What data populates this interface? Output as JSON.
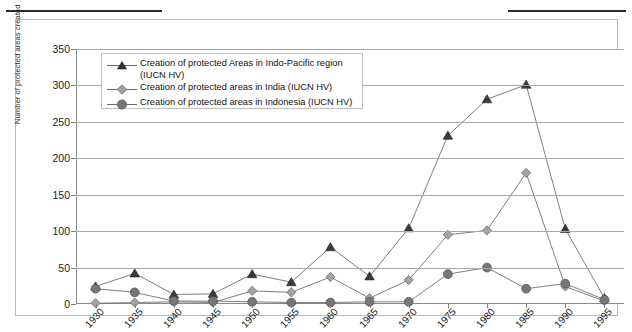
{
  "chart_data": {
    "type": "line",
    "title": "",
    "xlabel": "",
    "ylabel": "Number of protected areas created",
    "ylim": [
      0,
      350
    ],
    "ytick_labels": [
      "0",
      "50",
      "100",
      "150",
      "200",
      "250",
      "300",
      "350"
    ],
    "ytick_values": [
      0,
      50,
      100,
      150,
      200,
      250,
      300,
      350
    ],
    "grid": "horizontal",
    "legend_position": "top-left-inside",
    "categories": [
      "1930",
      "1935",
      "1940",
      "1945",
      "1950",
      "1955",
      "1960",
      "1965",
      "1970",
      "1975",
      "1980",
      "1985",
      "1990",
      "1995"
    ],
    "series": [
      {
        "name": "Creation of protected Areas in Indo-Pacific region (IUCN HV)",
        "marker": "triangle",
        "color": "#3a3a3a",
        "values": [
          24,
          42,
          13,
          14,
          41,
          30,
          78,
          38,
          104,
          231,
          281,
          301,
          103,
          8
        ]
      },
      {
        "name": "Creation of protected areas in India (IUCN HV)",
        "marker": "diamond",
        "color": "#8c8c8c",
        "values": [
          1,
          2,
          3,
          2,
          18,
          16,
          37,
          8,
          33,
          95,
          101,
          180,
          24,
          4
        ]
      },
      {
        "name": "Creation of protected areas in Indonesia (IUCN HV)",
        "marker": "circle",
        "color": "#6b6b6b",
        "values": [
          21,
          16,
          4,
          4,
          3,
          2,
          2,
          3,
          3,
          41,
          50,
          21,
          28,
          6
        ]
      }
    ]
  },
  "legend": {
    "items": [
      {
        "label_line1": "Creation of protected Areas in Indo-Pacific region",
        "label_line2": "(IUCN HV)",
        "marker": "triangle"
      },
      {
        "label_line1": "Creation of protected areas in India (IUCN HV)",
        "label_line2": "",
        "marker": "diamond"
      },
      {
        "label_line1": "Creation of protected areas in Indonesia (IUCN HV)",
        "label_line2": "",
        "marker": "circle"
      }
    ]
  }
}
